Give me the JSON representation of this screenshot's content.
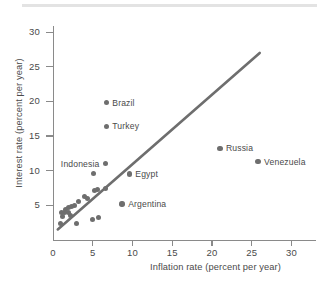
{
  "chart_data": {
    "type": "scatter",
    "title": "",
    "xlabel": "Inflation rate (percent per year)",
    "ylabel": "Interest rate (percent per year)",
    "xlim": [
      0,
      33
    ],
    "ylim": [
      0,
      33
    ],
    "xticks": [
      0,
      5,
      10,
      15,
      20,
      25,
      30
    ],
    "yticks": [
      5,
      10,
      15,
      20,
      25,
      30
    ],
    "grid": false,
    "legend": "none",
    "series": [
      {
        "name": "Countries",
        "marker": "circle",
        "color": "#6e6e6e",
        "points": [
          {
            "label": "Brazil",
            "x": 6.7,
            "y": 19.8,
            "label_pos": "right"
          },
          {
            "label": "Turkey",
            "x": 6.7,
            "y": 16.4,
            "label_pos": "right"
          },
          {
            "label": "Russia",
            "x": 21.0,
            "y": 13.2,
            "label_pos": "right"
          },
          {
            "label": "Venezuela",
            "x": 25.8,
            "y": 11.3,
            "label_pos": "right"
          },
          {
            "label": "Indonesia",
            "x": 6.6,
            "y": 11.0,
            "label_pos": "left"
          },
          {
            "label": "Egypt",
            "x": 9.6,
            "y": 9.5,
            "label_pos": "right"
          },
          {
            "label": "Argentina",
            "x": 8.7,
            "y": 5.2,
            "label_pos": "right"
          },
          {
            "label": "",
            "x": 5.1,
            "y": 9.6,
            "label_pos": "none"
          },
          {
            "label": "",
            "x": 5.2,
            "y": 7.1,
            "label_pos": "none"
          },
          {
            "label": "",
            "x": 5.6,
            "y": 7.3,
            "label_pos": "none"
          },
          {
            "label": "",
            "x": 6.6,
            "y": 7.4,
            "label_pos": "none"
          },
          {
            "label": "",
            "x": 4.0,
            "y": 6.3,
            "label_pos": "none"
          },
          {
            "label": "",
            "x": 4.4,
            "y": 6.0,
            "label_pos": "none"
          },
          {
            "label": "",
            "x": 3.2,
            "y": 5.5,
            "label_pos": "none"
          },
          {
            "label": "",
            "x": 2.7,
            "y": 5.0,
            "label_pos": "none"
          },
          {
            "label": "",
            "x": 2.3,
            "y": 4.8,
            "label_pos": "none"
          },
          {
            "label": "",
            "x": 1.9,
            "y": 4.6,
            "label_pos": "none"
          },
          {
            "label": "",
            "x": 1.6,
            "y": 4.4,
            "label_pos": "none"
          },
          {
            "label": "",
            "x": 1.1,
            "y": 3.9,
            "label_pos": "none"
          },
          {
            "label": "",
            "x": 1.5,
            "y": 3.9,
            "label_pos": "none"
          },
          {
            "label": "",
            "x": 2.0,
            "y": 3.9,
            "label_pos": "none"
          },
          {
            "label": "",
            "x": 1.2,
            "y": 3.3,
            "label_pos": "none"
          },
          {
            "label": "",
            "x": 2.2,
            "y": 3.5,
            "label_pos": "none"
          },
          {
            "label": "",
            "x": 5.0,
            "y": 3.0,
            "label_pos": "none"
          },
          {
            "label": "",
            "x": 5.7,
            "y": 3.2,
            "label_pos": "none"
          },
          {
            "label": "",
            "x": 3.0,
            "y": 2.3,
            "label_pos": "none"
          },
          {
            "label": "",
            "x": 1.0,
            "y": 2.4,
            "label_pos": "none"
          }
        ]
      }
    ],
    "trendline": {
      "x0": 0.6,
      "y0": 1.5,
      "x1": 26.0,
      "y1": 27.0,
      "color": "#6e6e6e"
    }
  }
}
